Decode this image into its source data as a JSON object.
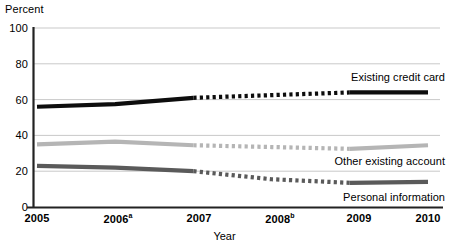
{
  "chart_data": {
    "type": "line",
    "title": "",
    "ylabel": "Percent",
    "xlabel": "Year",
    "categories": [
      "2005",
      "2006",
      "2007",
      "2008",
      "2009",
      "2010"
    ],
    "x_tick_labels": [
      "2005",
      "2006a",
      "2007",
      "2008b",
      "2009",
      "2010"
    ],
    "x_tick_footnotes": {
      "2006": "a",
      "2008": "b"
    },
    "ylim": [
      0,
      100
    ],
    "yticks": [
      0,
      20,
      40,
      60,
      80,
      100
    ],
    "grid": "horizontal",
    "legend_position": "inline-right-of-lines",
    "series": [
      {
        "name": "Existing credit card",
        "values": [
          56,
          57.5,
          61,
          62.5,
          64,
          64
        ],
        "color": "#0d0d0d",
        "solid_segments": [
          [
            0,
            2
          ],
          [
            4,
            5
          ]
        ],
        "dotted_segments": [
          [
            2,
            4
          ]
        ]
      },
      {
        "name": "Other existing account",
        "values": [
          35,
          36.5,
          34.5,
          33.5,
          32.5,
          34.5
        ],
        "color": "#b5b5b5",
        "solid_segments": [
          [
            0,
            2
          ],
          [
            4,
            5
          ]
        ],
        "dotted_segments": [
          [
            2,
            4
          ]
        ]
      },
      {
        "name": "Personal information",
        "values": [
          23,
          22,
          20,
          15.5,
          13.5,
          14
        ],
        "color": "#5a5a5a",
        "solid_segments": [
          [
            0,
            2
          ],
          [
            4,
            5
          ]
        ],
        "dotted_segments": [
          [
            2,
            4
          ]
        ]
      }
    ]
  },
  "axes": {
    "y_title": "Percent",
    "x_title": "Year",
    "y_tick_0": "0",
    "y_tick_20": "20",
    "y_tick_40": "40",
    "y_tick_60": "60",
    "y_tick_80": "80",
    "y_tick_100": "100"
  },
  "labels": {
    "existing_credit_card": "Existing credit card",
    "other_existing_account": "Other existing account",
    "personal_information": "Personal information"
  }
}
